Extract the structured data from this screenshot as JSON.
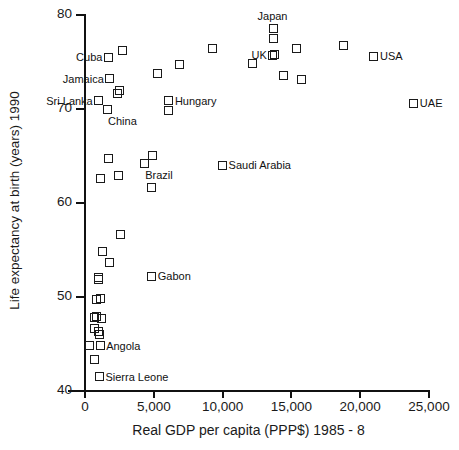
{
  "chart_data": {
    "type": "scatter",
    "title": "",
    "xlabel": "Real GDP per capita (PPP$) 1985 - 8",
    "ylabel": "Life expectancy at birth (years) 1990",
    "xlim": [
      0,
      25000
    ],
    "ylim": [
      40,
      80
    ],
    "grid": false,
    "legend": "none",
    "xticks": [
      {
        "value": 0,
        "label": "0"
      },
      {
        "value": 5000,
        "label": "5,000"
      },
      {
        "value": 10000,
        "label": "10,000"
      },
      {
        "value": 15000,
        "label": "15,000"
      },
      {
        "value": 20000,
        "label": "20,000"
      },
      {
        "value": 25000,
        "label": "25,000"
      }
    ],
    "yticks": [
      {
        "value": 80,
        "label": "80"
      },
      {
        "value": 70,
        "label": "70"
      },
      {
        "value": 60,
        "label": "60"
      },
      {
        "value": 50,
        "label": "50"
      },
      {
        "value": 40,
        "label": "40"
      }
    ],
    "marker": "open-square",
    "points": [
      {
        "x": 1700,
        "y": 75.5,
        "label": "Cuba",
        "label_pos": "left"
      },
      {
        "x": 2750,
        "y": 76.2,
        "label": ""
      },
      {
        "x": 1800,
        "y": 73.2,
        "label": "Jamaica",
        "label_pos": "left"
      },
      {
        "x": 1000,
        "y": 70.9,
        "label": "Sri Lanka",
        "label_pos": "left"
      },
      {
        "x": 1600,
        "y": 69.9,
        "label": "China",
        "label_pos": "below"
      },
      {
        "x": 2350,
        "y": 71.6,
        "label": ""
      },
      {
        "x": 2500,
        "y": 72.0,
        "label": ""
      },
      {
        "x": 6100,
        "y": 70.9,
        "label": "Hungary",
        "label_pos": "right"
      },
      {
        "x": 6100,
        "y": 69.8,
        "label": ""
      },
      {
        "x": 5250,
        "y": 73.8,
        "label": ""
      },
      {
        "x": 6900,
        "y": 74.7,
        "label": ""
      },
      {
        "x": 9300,
        "y": 76.4,
        "label": ""
      },
      {
        "x": 12200,
        "y": 74.8,
        "label": ""
      },
      {
        "x": 13700,
        "y": 78.6,
        "label": "Japan",
        "label_pos": "above"
      },
      {
        "x": 13700,
        "y": 77.5,
        "label": ""
      },
      {
        "x": 13650,
        "y": 75.7,
        "label": "UK",
        "label_pos": "left"
      },
      {
        "x": 13750,
        "y": 75.8,
        "label": ""
      },
      {
        "x": 15400,
        "y": 76.4,
        "label": ""
      },
      {
        "x": 14400,
        "y": 73.6,
        "label": ""
      },
      {
        "x": 15700,
        "y": 73.1,
        "label": ""
      },
      {
        "x": 18800,
        "y": 76.8,
        "label": ""
      },
      {
        "x": 21000,
        "y": 75.6,
        "label": "USA",
        "label_pos": "right"
      },
      {
        "x": 23900,
        "y": 70.6,
        "label": "UAE",
        "label_pos": "right"
      },
      {
        "x": 1700,
        "y": 64.7,
        "label": ""
      },
      {
        "x": 1150,
        "y": 62.6,
        "label": ""
      },
      {
        "x": 2400,
        "y": 62.9,
        "label": ""
      },
      {
        "x": 4300,
        "y": 64.2,
        "label": "Brazil",
        "label_pos": "below"
      },
      {
        "x": 4900,
        "y": 65.1,
        "label": ""
      },
      {
        "x": 4800,
        "y": 61.7,
        "label": ""
      },
      {
        "x": 10000,
        "y": 64.0,
        "label": "Saudi Arabia",
        "label_pos": "right"
      },
      {
        "x": 2600,
        "y": 56.7,
        "label": ""
      },
      {
        "x": 1250,
        "y": 54.8,
        "label": ""
      },
      {
        "x": 1750,
        "y": 53.7,
        "label": ""
      },
      {
        "x": 950,
        "y": 52.1,
        "label": ""
      },
      {
        "x": 1000,
        "y": 51.9,
        "label": ""
      },
      {
        "x": 4850,
        "y": 52.2,
        "label": "Gabon",
        "label_pos": "right"
      },
      {
        "x": 800,
        "y": 49.7,
        "label": ""
      },
      {
        "x": 1150,
        "y": 49.8,
        "label": ""
      },
      {
        "x": 700,
        "y": 47.8,
        "label": ""
      },
      {
        "x": 850,
        "y": 47.9,
        "label": ""
      },
      {
        "x": 1200,
        "y": 47.7,
        "label": ""
      },
      {
        "x": 700,
        "y": 46.6,
        "label": ""
      },
      {
        "x": 1000,
        "y": 46.3,
        "label": ""
      },
      {
        "x": 1050,
        "y": 46.0,
        "label": ""
      },
      {
        "x": 350,
        "y": 44.8,
        "label": ""
      },
      {
        "x": 1100,
        "y": 44.8,
        "label": "Angola",
        "label_pos": "right"
      },
      {
        "x": 700,
        "y": 43.3,
        "label": ""
      },
      {
        "x": 1050,
        "y": 41.5,
        "label": "Sierra Leone",
        "label_pos": "right"
      }
    ]
  }
}
